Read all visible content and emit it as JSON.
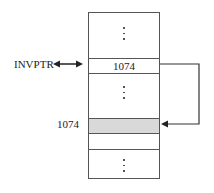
{
  "diagram": {
    "pointer_label": "INVPTR",
    "pointer_cell_value": "1074",
    "target_address_label": "1074",
    "ellipsis": "⋮",
    "colors": {
      "line": "#555555",
      "highlight_cell": "#d9d9d9",
      "background": "#ffffff"
    },
    "cells": [
      {
        "name": "top-ellipsis-cell",
        "content": "⋮"
      },
      {
        "name": "pointer-cell",
        "content": "1074"
      },
      {
        "name": "middle-ellipsis-cell",
        "content": "⋮"
      },
      {
        "name": "target-cell",
        "content": "",
        "highlighted": true
      },
      {
        "name": "empty-cell",
        "content": ""
      },
      {
        "name": "bottom-ellipsis-cell",
        "content": "⋮"
      }
    ]
  }
}
